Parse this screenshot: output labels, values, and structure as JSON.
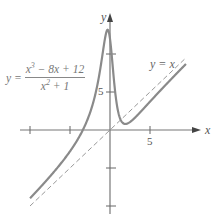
{
  "chart_data": {
    "type": "line",
    "title": "",
    "xlabel": "x",
    "ylabel": "y",
    "xlim": [
      -11,
      12.5
    ],
    "ylim": [
      -11,
      15
    ],
    "x_ticks": [
      -10,
      -5,
      5
    ],
    "y_ticks": [
      -10,
      -5,
      5,
      10
    ],
    "x_tick_labels": {
      "5": "5"
    },
    "y_tick_labels": {
      "5": "5"
    },
    "grid": false,
    "series": [
      {
        "name": "y = (x^3 - 8x + 12)/(x^2 + 1)",
        "style": "solid",
        "color": "#8a8a8a",
        "x": [
          -10,
          -8,
          -6,
          -4,
          -3,
          -2,
          -1.5,
          -1,
          -0.6,
          -0.3,
          0,
          0.3,
          0.6,
          1,
          1.5,
          2,
          2.5,
          3,
          4,
          5,
          6,
          8,
          9.5
        ],
        "y": [
          -9.13,
          -6.94,
          -4.86,
          -2.82,
          -1.5,
          1.6,
          4.73,
          8.5,
          11.76,
          13.16,
          12.0,
          9.58,
          6.76,
          2.5,
          0.65,
          0.8,
          1.17,
          1.5,
          2.47,
          3.35,
          4.46,
          6.31,
          7.72
        ]
      },
      {
        "name": "y = x",
        "style": "dashed",
        "color": "#8a8a8a",
        "x": [
          -10,
          9.5
        ],
        "y": [
          -10,
          9.5
        ]
      }
    ],
    "annotations": [
      {
        "text": "y = (x³ − 8x + 12)/(x² + 1)",
        "position": "upper-left"
      },
      {
        "text": "y = x",
        "position": "upper-right"
      }
    ]
  },
  "labels": {
    "y_axis": "y",
    "x_axis": "x",
    "x_tick_5": "5",
    "y_tick_5": "5",
    "eq_lhs": "y =",
    "numerator_a": "x",
    "numerator_a_exp": "3",
    "numerator_rest": " − 8x + 12",
    "denominator_a": "x",
    "denominator_a_exp": "2",
    "denominator_rest": " + 1",
    "asymptote_label": "y = x"
  }
}
